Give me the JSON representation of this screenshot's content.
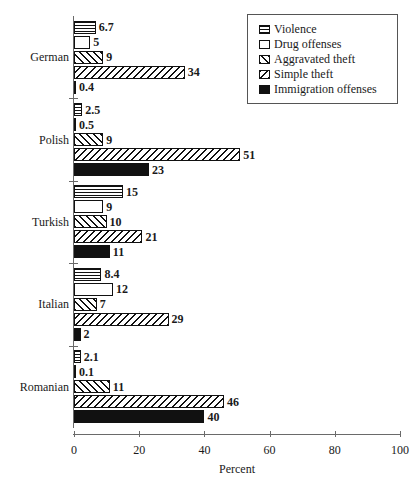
{
  "chart_data": {
    "type": "bar",
    "orientation": "horizontal",
    "title": "",
    "xlabel": "Percent",
    "ylabel": "",
    "xlim": [
      0,
      100
    ],
    "xticks": [
      0,
      20,
      40,
      60,
      80,
      100
    ],
    "grid": false,
    "legend_position": "top-right",
    "categories": [
      "German",
      "Polish",
      "Turkish",
      "Italian",
      "Romanian"
    ],
    "series": [
      {
        "name": "Violence",
        "pattern": "horizontal-lines",
        "values": [
          6.7,
          2.5,
          15,
          8.4,
          2.1
        ],
        "labels": [
          "6.7",
          "2.5",
          "15",
          "8.4",
          "2.1"
        ]
      },
      {
        "name": "Drug offenses",
        "pattern": "blank",
        "values": [
          5,
          0.5,
          9,
          12,
          0.1
        ],
        "labels": [
          "5",
          "0.5",
          "9",
          "12",
          "0.1"
        ]
      },
      {
        "name": "Aggravated theft",
        "pattern": "forward-diagonal",
        "values": [
          9,
          9,
          10,
          7,
          11
        ],
        "labels": [
          "9",
          "9",
          "10",
          "7",
          "11"
        ]
      },
      {
        "name": "Simple theft",
        "pattern": "back-diagonal",
        "values": [
          34,
          51,
          21,
          29,
          46
        ],
        "labels": [
          "34",
          "51",
          "21",
          "29",
          "46"
        ]
      },
      {
        "name": "Immigration offenses",
        "pattern": "solid-black",
        "values": [
          0.4,
          23,
          11,
          2,
          40
        ],
        "labels": [
          "0.4",
          "23",
          "11",
          "2",
          "40"
        ]
      }
    ]
  },
  "legend": {
    "items": [
      {
        "label": "Violence"
      },
      {
        "label": "Drug offenses"
      },
      {
        "label": "Aggravated theft"
      },
      {
        "label": "Simple theft"
      },
      {
        "label": "Immigration offenses"
      }
    ]
  },
  "axis": {
    "x_title": "Percent",
    "x_tick_labels": [
      "0",
      "20",
      "40",
      "60",
      "80",
      "100"
    ],
    "y_tick_labels": [
      "German",
      "Polish",
      "Turkish",
      "Italian",
      "Romanian"
    ]
  },
  "colors": {
    "ink": "#111111",
    "axis": "#6a6a6a",
    "background": "#ffffff"
  }
}
